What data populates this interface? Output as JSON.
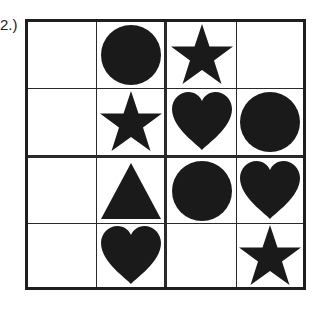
{
  "label": "2.)",
  "grid": {
    "rows": 4,
    "cols": 4,
    "cells": [
      [
        "empty",
        "circle",
        "star",
        "empty"
      ],
      [
        "empty",
        "star",
        "heart",
        "circle"
      ],
      [
        "empty",
        "triangle",
        "circle",
        "heart"
      ],
      [
        "empty",
        "heart",
        "empty",
        "star"
      ]
    ]
  },
  "colors": {
    "shape": "#1a1a1a",
    "line": "#1e1e1e",
    "background": "#ffffff"
  }
}
